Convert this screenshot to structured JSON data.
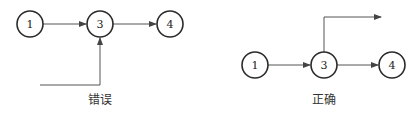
{
  "diagrams": [
    {
      "caption": "错误",
      "nodes": [
        {
          "id": "1",
          "label": "1"
        },
        {
          "id": "3",
          "label": "3"
        },
        {
          "id": "4",
          "label": "4"
        }
      ],
      "edges": [
        {
          "from": "1",
          "to": "3"
        },
        {
          "from": "3",
          "to": "4"
        },
        {
          "from": "external",
          "to": "3",
          "note": "incoming line from lower-left into node 3"
        }
      ]
    },
    {
      "caption": "正确",
      "nodes": [
        {
          "id": "1",
          "label": "1"
        },
        {
          "id": "3",
          "label": "3"
        },
        {
          "id": "4",
          "label": "4"
        }
      ],
      "edges": [
        {
          "from": "1",
          "to": "3"
        },
        {
          "from": "3",
          "to": "4"
        },
        {
          "from": "3",
          "to": "external",
          "note": "outgoing line from top of node 3 to upper-right"
        }
      ]
    }
  ]
}
